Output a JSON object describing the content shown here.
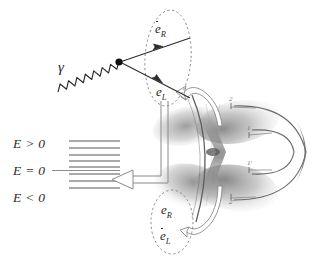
{
  "figure": {
    "background_color": "#ffffff",
    "ink_color": "#2b2b2b",
    "grey_color": "#9a9a9a",
    "shade_color": "#b8b8b8",
    "dark_crescent_color": "#8c8c8c"
  },
  "photon": {
    "symbol": "γ",
    "name": "gamma-photon",
    "style": "wavy-line"
  },
  "vertex": {
    "name": "interaction-vertex",
    "shape": "filled-dot"
  },
  "top_ellipse": {
    "name": "outgoing-pair-grouping",
    "border": "dashed",
    "particles": [
      {
        "base": "e",
        "bar": true,
        "sub": "R",
        "label": "ēR"
      },
      {
        "base": "e",
        "bar": false,
        "sub": "L",
        "label": "eL"
      }
    ]
  },
  "bottom_ellipse": {
    "name": "sea-pair-grouping",
    "border": "dashed",
    "particles": [
      {
        "base": "e",
        "bar": false,
        "sub": "R",
        "label": "eR"
      },
      {
        "base": "e",
        "bar": true,
        "sub": "L",
        "label": "ēL"
      }
    ]
  },
  "energy_levels": {
    "name": "dirac-sea-energy-levels",
    "labels": [
      {
        "text": "E > 0",
        "region": "positive"
      },
      {
        "text": "E = 0",
        "region": "zero"
      },
      {
        "text": "E < 0",
        "region": "negative"
      }
    ],
    "level_count_above": 5,
    "level_count_below": 3,
    "zero_line": true,
    "line_color": "#8e8e8e"
  },
  "cone": {
    "name": "double-cone-hourglass",
    "description": "shaded hourglass / trumpet double-cone",
    "arc": "vertical-arc-overlay"
  },
  "loop_labels": [
    {
      "text": "2",
      "position": "upper-outer"
    },
    {
      "text": "1",
      "position": "upper-inner"
    },
    {
      "text": "1'",
      "position": "lower-inner"
    },
    {
      "text": "2'",
      "position": "lower-outer"
    }
  ],
  "arrows": {
    "to_energy_levels": {
      "name": "double-line-arrow-to-levels",
      "style": "hollow-double-line",
      "head": "hollow-triangle"
    },
    "curve_top": {
      "name": "curved-arrow-to-top-ellipse",
      "style": "hollow-curve",
      "head": "hollow-arrowhead"
    },
    "curve_bottom": {
      "name": "curved-arrow-to-bottom-ellipse",
      "style": "hollow-curve",
      "head": "hollow-arrowhead"
    }
  }
}
